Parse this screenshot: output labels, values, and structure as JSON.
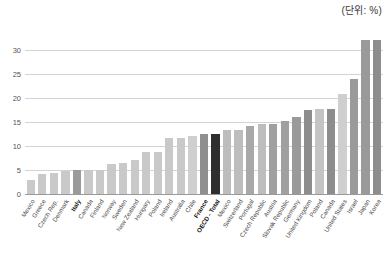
{
  "unit_caption": "(단위: %)",
  "chart_data": {
    "type": "bar",
    "title": "",
    "subtitle": "",
    "xlabel": "",
    "ylabel": "",
    "unit": "%",
    "unit_note": "(단위: %)",
    "ylim": [
      0,
      32.5
    ],
    "yticks": [
      0,
      5,
      10,
      15,
      20,
      25,
      30
    ],
    "ytick_labels": [
      "0",
      "5",
      "10",
      "15",
      "20",
      "25",
      "30"
    ],
    "grid": true,
    "legend": "none",
    "orientation": "vertical",
    "sorted": "ascending",
    "categories": [
      "Mexico",
      "Greece",
      "Czech Rep.",
      "Denmark",
      "Italy",
      "Canada",
      "Finland",
      "Norway",
      "Sweden",
      "New Zealand",
      "Hungary",
      "Poland",
      "Ireland",
      "Australia",
      "Chile",
      "France",
      "OECD - Total",
      "Mexico",
      "Switzerland",
      "Portugal",
      "Czech Republic",
      "Austria",
      "Slovak Republic",
      "Germany",
      "United Kingdom",
      "Poland",
      "Canada",
      "United States",
      "Israel",
      "Japan",
      "Korea"
    ],
    "values": [
      3.0,
      4.2,
      4.3,
      4.7,
      5.0,
      5.0,
      5.0,
      6.2,
      6.4,
      7.0,
      8.8,
      8.8,
      11.6,
      11.6,
      12.0,
      12.6,
      12.6,
      13.4,
      13.4,
      14.2,
      14.6,
      14.6,
      15.2,
      16.1,
      17.5,
      17.8,
      17.8,
      20.8,
      24.0,
      32.0,
      32.0
    ],
    "highlights": [
      {
        "category": "Italy",
        "style": "bold-dark-bar"
      },
      {
        "category": "France",
        "style": "bold-dark-bar"
      },
      {
        "category": "OECD - Total",
        "style": "bold-black-bar"
      }
    ],
    "bar_colors": [
      "#c9c9c9",
      "#c9c9c9",
      "#c9c9c9",
      "#c9c9c9",
      "#9a9a9a",
      "#c9c9c9",
      "#c9c9c9",
      "#c9c9c9",
      "#c9c9c9",
      "#c9c9c9",
      "#c9c9c9",
      "#c9c9c9",
      "#c9c9c9",
      "#c9c9c9",
      "#cfcfcf",
      "#8f8f8f",
      "#2e2e2e",
      "#bdbdbd",
      "#bdbdbd",
      "#a8a8a8",
      "#bdbdbd",
      "#a0a0a0",
      "#a0a0a0",
      "#9a9a9a",
      "#8d8d8d",
      "#c4c4c4",
      "#8d8d8d",
      "#cfcfcf",
      "#9a9a9a",
      "#9a9a9a",
      "#8d8d8d"
    ]
  },
  "colors": {
    "bar_default": "#c9c9c9",
    "bar_highlight": "#8f8f8f",
    "bar_oecd_total": "#2e2e2e",
    "gridline": "#d4d4d4",
    "axis": "#9a9a9a",
    "text": "#4a4a4a"
  }
}
